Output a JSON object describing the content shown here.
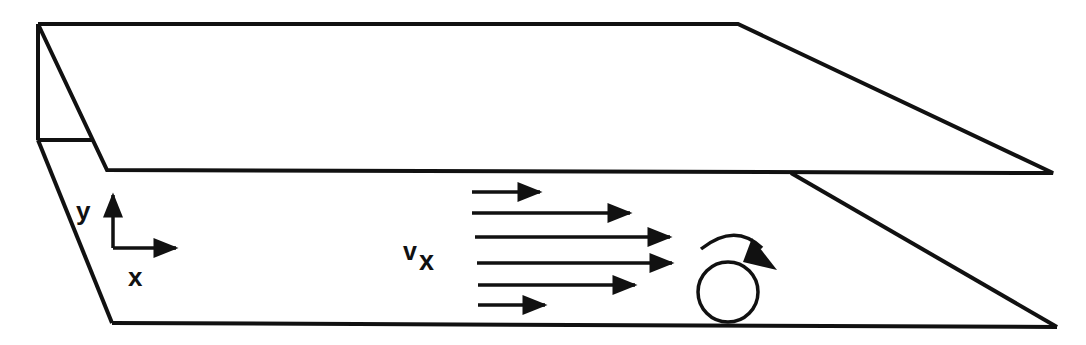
{
  "diagram": {
    "colors": {
      "line": "#111111",
      "background": "#ffffff"
    },
    "axes": {
      "y_label": "y",
      "x_label": "x"
    },
    "velocity_label": {
      "main": "v",
      "subscript": "x"
    },
    "velocity_arrows": [
      {
        "x1": 472,
        "x2": 540,
        "y": 192
      },
      {
        "x1": 472,
        "x2": 630,
        "y": 213
      },
      {
        "x1": 475,
        "x2": 670,
        "y": 237
      },
      {
        "x1": 477,
        "x2": 672,
        "y": 263
      },
      {
        "x1": 478,
        "x2": 635,
        "y": 285
      },
      {
        "x1": 478,
        "x2": 545,
        "y": 305
      }
    ],
    "rotation_icon": "clockwise-rotation-arrow",
    "particle": "circle"
  }
}
